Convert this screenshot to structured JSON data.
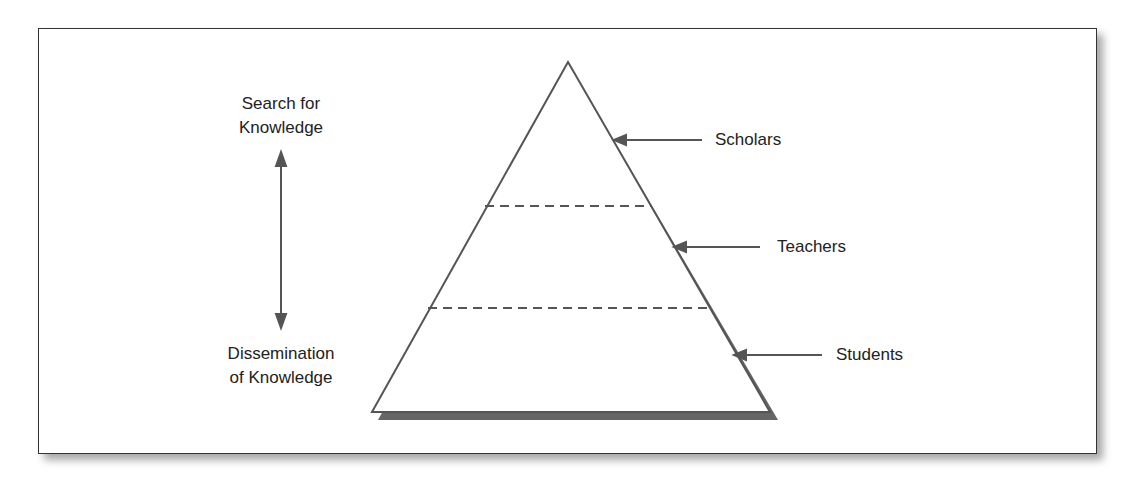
{
  "diagram": {
    "top_label": [
      "Search for",
      "Knowledge"
    ],
    "bottom_label": [
      "Dissemination",
      "of Knowledge"
    ],
    "tiers": [
      {
        "label": "Scholars"
      },
      {
        "label": "Teachers"
      },
      {
        "label": "Students"
      }
    ],
    "colors": {
      "line": "#555555",
      "shadow": "#666666",
      "text": "#222222"
    }
  }
}
